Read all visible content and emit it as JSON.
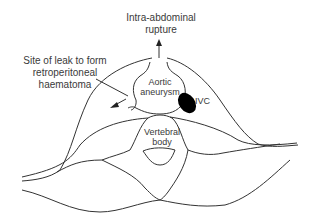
{
  "diagram": {
    "labels": {
      "rupture_line1": "Intra-abdominal",
      "rupture_line2": "rupture",
      "leak_line1": "Site of leak to form",
      "leak_line2": "retroperitoneal",
      "leak_line3": "haematoma",
      "aortic_line1": "Aortic",
      "aortic_line2": "aneurysm",
      "ivc": "IVC",
      "vertebral_line1": "Vertebral",
      "vertebral_line2": "body"
    },
    "colors": {
      "line": "#333333",
      "text": "#3a3a3a",
      "ivc_fill": "#000000",
      "background": "#ffffff"
    }
  }
}
